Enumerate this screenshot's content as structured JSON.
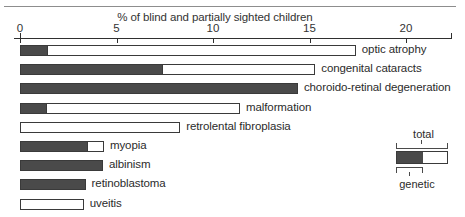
{
  "chart_data": {
    "type": "bar",
    "orientation": "horizontal",
    "title": "% of blind and partially sighted children",
    "xlabel": "",
    "ylabel": "",
    "xlim": [
      0,
      22.7
    ],
    "grid": false,
    "tick_values": [
      0,
      5,
      10,
      15,
      20
    ],
    "tick_labels": [
      "0",
      "5",
      "10",
      "15",
      "20"
    ],
    "categories": [
      "optic atrophy",
      "congenital cataracts",
      "choroido-retinal degeneration",
      "malformation",
      "retrolental fibroplasia",
      "myopia",
      "albinism",
      "retinoblastoma",
      "uveitis"
    ],
    "series": [
      {
        "name": "total",
        "values": [
          17.4,
          15.3,
          14.4,
          11.4,
          8.3,
          4.35,
          4.3,
          3.4,
          3.3
        ]
      },
      {
        "name": "genetic",
        "values": [
          1.45,
          7.4,
          14.4,
          1.4,
          0.0,
          3.5,
          4.3,
          3.4,
          0.0
        ]
      }
    ],
    "legend": {
      "position": "bottom-right",
      "total_label": "total",
      "genetic_label": "genetic",
      "total_color": "#ffffff",
      "genetic_color": "#4a4a4a",
      "outline_color": "#3a3a3a"
    }
  }
}
